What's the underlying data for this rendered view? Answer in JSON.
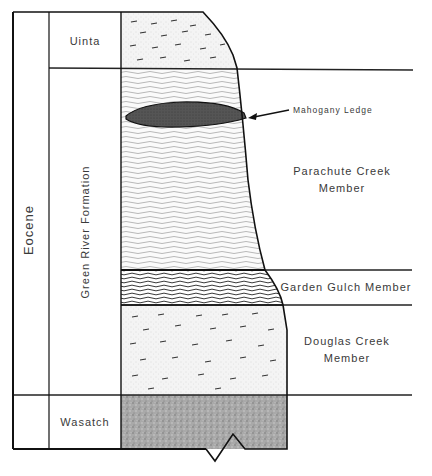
{
  "diagram": {
    "type": "stratigraphic-column",
    "epoch": "Eocene",
    "formation_column": {
      "uinta": "Uinta",
      "green_river": "Green River Formation",
      "wasatch": "Wasatch"
    },
    "members": {
      "parachute_line1": "Parachute Creek",
      "parachute_line2": "Member",
      "garden_gulch": "Garden Gulch Member",
      "douglas_line1": "Douglas Creek",
      "douglas_line2": "Member"
    },
    "annotation": {
      "mahogany": "Mahogany Ledge"
    },
    "units_top_to_bottom": [
      {
        "name": "Uinta",
        "pattern": "dashes-stipple"
      },
      {
        "name": "Parachute Creek Member",
        "pattern": "wavy-fine-lamination",
        "feature": "Mahogany Ledge"
      },
      {
        "name": "Garden Gulch Member",
        "pattern": "wavy-lines"
      },
      {
        "name": "Douglas Creek Member",
        "pattern": "dashes-stipple"
      },
      {
        "name": "Wasatch",
        "pattern": "dense-stipple"
      }
    ]
  }
}
